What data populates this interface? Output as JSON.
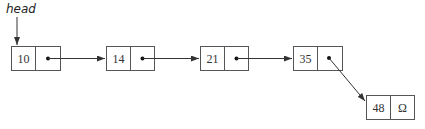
{
  "diagram": {
    "type": "singly-linked-list",
    "head_label": "head",
    "nodes": [
      {
        "value": "10",
        "next": "pointer"
      },
      {
        "value": "14",
        "next": "pointer"
      },
      {
        "value": "21",
        "next": "pointer"
      },
      {
        "value": "35",
        "next": "pointer"
      },
      {
        "value": "48",
        "next": "Ω"
      }
    ],
    "null_symbol": "Ω"
  }
}
